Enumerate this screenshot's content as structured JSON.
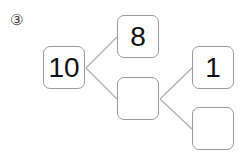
{
  "problem": {
    "number_label": "③"
  },
  "tree": {
    "root": {
      "value": "10"
    },
    "level1": [
      {
        "value": "8"
      },
      {
        "value": ""
      }
    ],
    "level2": [
      {
        "value": "1"
      },
      {
        "value": ""
      }
    ]
  },
  "colors": {
    "box_border": "#9a9a9a",
    "line": "#b0b0b0",
    "text": "#111111"
  }
}
